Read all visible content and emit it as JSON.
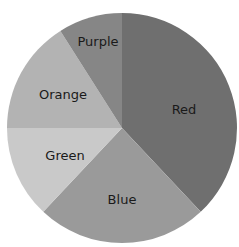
{
  "chart_data": {
    "type": "pie",
    "title": "",
    "start_angle_deg": 0,
    "direction": "clockwise",
    "categories": [
      "Red",
      "Blue",
      "Green",
      "Orange",
      "Purple"
    ],
    "values": [
      38,
      24,
      13,
      16,
      9
    ],
    "unit": "percent (estimated)",
    "legend": "none (labels inside slices)",
    "slices": [
      {
        "label": "Red",
        "value": 38,
        "color": "#6f6f6f",
        "label_pos": [
          184,
          110
        ]
      },
      {
        "label": "Blue",
        "value": 24,
        "color": "#9a9a9a",
        "label_pos": [
          122,
          200
        ]
      },
      {
        "label": "Green",
        "value": 13,
        "color": "#c9c9c9",
        "label_pos": [
          65,
          156
        ]
      },
      {
        "label": "Orange",
        "value": 16,
        "color": "#b3b3b3",
        "label_pos": [
          63,
          95
        ]
      },
      {
        "label": "Purple",
        "value": 9,
        "color": "#868686",
        "label_pos": [
          98,
          42
        ]
      }
    ]
  },
  "geometry": {
    "cx": 122,
    "cy": 128,
    "r": 115
  }
}
